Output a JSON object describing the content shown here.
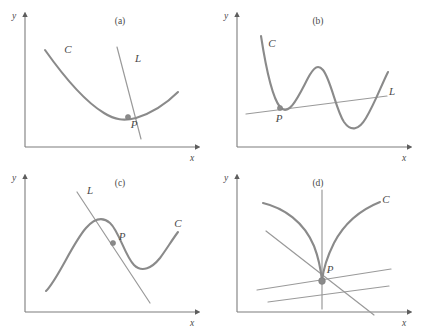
{
  "figure": {
    "background_color": "#ffffff",
    "curve_color": "#8a8a8a",
    "line_color": "#9a9a9a",
    "axis_color": "#7d7d7d",
    "label_color": "#4a4a4a"
  },
  "panels": [
    {
      "id": "a",
      "caption": "(a)",
      "caption_x": 120,
      "caption_y": 24,
      "origin": {
        "x": 25,
        "y": 147
      },
      "y_axis": {
        "x": 25,
        "y_top": 16,
        "y_bottom": 147,
        "label": "y",
        "label_x": 14,
        "label_y": 19
      },
      "x_axis": {
        "y": 147,
        "x_left": 25,
        "x_right": 196,
        "label": "x",
        "label_x": 192,
        "label_y": 161
      },
      "curve": {
        "name": "C",
        "label": "C",
        "label_x": 68,
        "label_y": 53,
        "path": "M 45,50 C 62,74 84,101 104,113 C 115,120 124,121 136,118 C 152,113 167,103 178,92"
      },
      "lines": [
        {
          "name": "L",
          "label": "L",
          "label_x": 138,
          "label_y": 62,
          "x1": 117,
          "y1": 47,
          "x2": 141,
          "y2": 139
        }
      ],
      "point": {
        "label": "P",
        "x": 128,
        "y": 117,
        "label_x": 134,
        "label_y": 128,
        "radius": 2.6
      }
    },
    {
      "id": "b",
      "caption": "(b)",
      "caption_x": 318,
      "caption_y": 24,
      "origin": {
        "x": 237,
        "y": 147
      },
      "y_axis": {
        "x": 237,
        "y_top": 16,
        "y_bottom": 147,
        "label": "y",
        "label_x": 226,
        "label_y": 19
      },
      "x_axis": {
        "y": 147,
        "x_left": 237,
        "x_right": 408,
        "label": "x",
        "label_x": 404,
        "label_y": 161
      },
      "curve": {
        "name": "C",
        "label": "C",
        "label_x": 272,
        "label_y": 47,
        "path": "M 261,36 C 265,62 272,97 280,107 C 289,118 299,95 308,78 C 314,67 318,64 323,70 C 331,80 336,110 344,122 C 351,132 359,130 366,118 C 375,103 381,86 388,72"
      },
      "lines": [
        {
          "name": "L",
          "label": "L",
          "label_x": 392,
          "label_y": 95,
          "x1": 246,
          "y1": 114,
          "x2": 387,
          "y2": 96
        }
      ],
      "point": {
        "label": "P",
        "x": 280,
        "y": 108,
        "label_x": 279,
        "label_y": 122,
        "radius": 2.6
      }
    },
    {
      "id": "c",
      "caption": "(c)",
      "caption_x": 120,
      "caption_y": 186,
      "origin": {
        "x": 25,
        "y": 312
      },
      "y_axis": {
        "x": 25,
        "y_top": 178,
        "y_bottom": 312,
        "label": "y",
        "label_x": 14,
        "label_y": 181
      },
      "x_axis": {
        "y": 312,
        "x_left": 25,
        "x_right": 196,
        "label": "x",
        "label_x": 192,
        "label_y": 326
      },
      "curve": {
        "name": "C",
        "label": "C",
        "label_x": 178,
        "label_y": 227,
        "path": "M 46,291 C 58,279 72,244 86,228 C 94,219 102,216 110,223 C 119,231 125,256 134,265 C 142,273 152,268 160,258 C 166,250 172,240 178,232"
      },
      "lines": [
        {
          "name": "L",
          "label": "L",
          "label_x": 90,
          "label_y": 194,
          "x1": 77,
          "y1": 192,
          "x2": 150,
          "y2": 303
        }
      ],
      "point": {
        "label": "P",
        "x": 113,
        "y": 243,
        "label_x": 122,
        "label_y": 240,
        "radius": 2.6
      }
    },
    {
      "id": "d",
      "caption": "(d)",
      "caption_x": 318,
      "caption_y": 186,
      "origin": {
        "x": 237,
        "y": 312
      },
      "y_axis": {
        "x": 237,
        "y_top": 178,
        "y_bottom": 312,
        "label": "y",
        "label_x": 226,
        "label_y": 181
      },
      "x_axis": {
        "y": 312,
        "x_left": 237,
        "x_right": 408,
        "label": "x",
        "label_x": 404,
        "label_y": 326
      },
      "curve": {
        "name": "C",
        "label": "C",
        "label_x": 386,
        "label_y": 203,
        "path": "M 263,203 C 284,208 304,222 314,246 C 319,259 321,271 322,281 C 323,271 327,257 334,243 C 346,220 365,208 380,202"
      },
      "lines": [
        {
          "name": "L1",
          "x1": 322,
          "y1": 190,
          "x2": 322,
          "y2": 309
        },
        {
          "name": "L2",
          "x1": 266,
          "y1": 231,
          "x2": 374,
          "y2": 315
        },
        {
          "name": "L3",
          "x1": 257,
          "y1": 290,
          "x2": 391,
          "y2": 269
        },
        {
          "name": "L4",
          "x1": 268,
          "y1": 302,
          "x2": 389,
          "y2": 286
        }
      ],
      "point": {
        "label": "P",
        "x": 322,
        "y": 281,
        "label_x": 330,
        "label_y": 273,
        "radius": 3.4
      }
    }
  ]
}
